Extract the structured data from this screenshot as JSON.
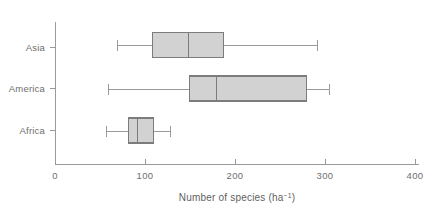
{
  "chart_data": {
    "type": "box",
    "title": "",
    "xlabel": "Number of species (ha⁻¹)",
    "ylabel": "",
    "categories": [
      "Asia",
      "America",
      "Africa"
    ],
    "xlim": [
      0,
      400
    ],
    "xticks": [
      0,
      100,
      200,
      300,
      400
    ],
    "xtick_labels": [
      "0",
      "100",
      "200",
      "300",
      "400"
    ],
    "grid": false,
    "legend": "none",
    "orientation": "horizontal",
    "boxes": [
      {
        "category": "Asia",
        "whisker_low": 68,
        "q1": 108,
        "median": 147,
        "q3": 187,
        "whisker_high": 291
      },
      {
        "category": "America",
        "whisker_low": 58,
        "q1": 149,
        "median": 178,
        "q3": 279,
        "whisker_high": 304
      },
      {
        "category": "Africa",
        "whisker_low": 56,
        "q1": 81,
        "median": 90,
        "q3": 109,
        "whisker_high": 127
      }
    ],
    "colors": {
      "box_fill": "#d2d2d2",
      "box_stroke": "#7c7c7c",
      "whisker": "#9a9a9a",
      "axis": "#9a9a9a",
      "text": "#6e6e6e",
      "background": "#ffffff"
    }
  },
  "axis_title_parts": {
    "main": "Number of species (ha",
    "superscript": "−1",
    "tail": ")"
  }
}
